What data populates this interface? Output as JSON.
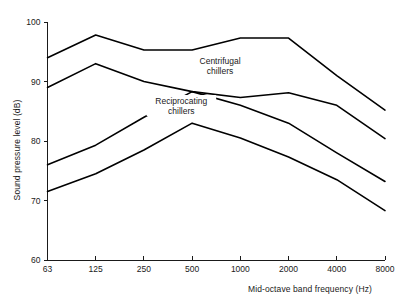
{
  "chart_data": {
    "type": "line",
    "title": "",
    "subtitle": "",
    "xlabel": "Mid-octave band frequency (Hz)",
    "ylabel": "Sound pressure level (dB)",
    "x": [
      63,
      125,
      250,
      500,
      1000,
      2000,
      4000,
      8000
    ],
    "xtick_labels": [
      "63",
      "125",
      "250",
      "500",
      "1000",
      "2000",
      "4000",
      "8000"
    ],
    "x_scale": "log-octave",
    "ytick_labels": [
      "100",
      "90",
      "80",
      "70",
      "60"
    ],
    "yticks": [
      100,
      90,
      80,
      70,
      60
    ],
    "ylim": [
      60,
      100
    ],
    "grid": false,
    "legend_position": "inline-annotation",
    "series": [
      {
        "name": "Centrifugal chillers upper bound",
        "group": "Centrifugal chillers",
        "values": [
          94.0,
          97.8,
          95.3,
          95.3,
          97.3,
          97.3,
          91.0,
          85.2
        ]
      },
      {
        "name": "Centrifugal chillers lower bound",
        "group": "Centrifugal chillers",
        "values": [
          89.0,
          93.0,
          90.0,
          88.3,
          87.3,
          88.1,
          86.0,
          80.4
        ]
      },
      {
        "name": "Reciprocating chillers upper bound",
        "group": "Reciprocating chillers",
        "values": [
          76.0,
          79.3,
          84.0,
          88.3,
          86.0,
          83.0,
          78.0,
          73.2
        ]
      },
      {
        "name": "Reciprocating chillers lower bound",
        "group": "Reciprocating chillers",
        "values": [
          71.5,
          74.5,
          78.5,
          83.0,
          80.5,
          77.3,
          73.5,
          68.3
        ]
      }
    ],
    "annotations": [
      {
        "id": "centrifugal",
        "line1": "Centrifugal",
        "line2": "chillers",
        "x": 750,
        "y": 93.0
      },
      {
        "id": "reciprocating",
        "line1": "Reciprocating",
        "line2": "chillers",
        "x": 430,
        "y": 86.2
      }
    ],
    "colors": {
      "curve": "#000000",
      "axis": "#1a1a1a",
      "text": "#1a1a1a",
      "background": "#ffffff"
    }
  }
}
